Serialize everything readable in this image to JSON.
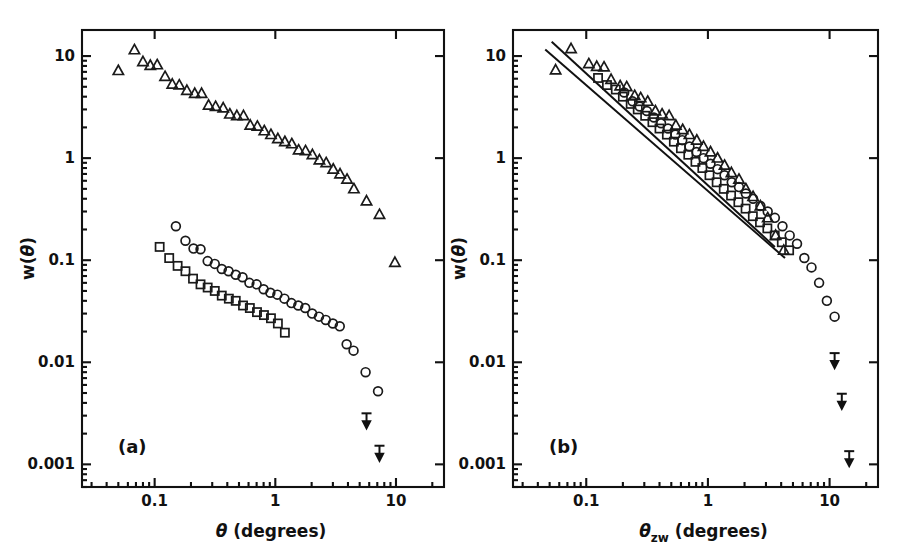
{
  "figure": {
    "caption_panels": [
      "(a)",
      "(b)"
    ],
    "background": "#ffffff",
    "ink": "#111111"
  },
  "panel_a": {
    "label": "(a)",
    "xlabel_symbol": "θ",
    "xlabel_units": "(degrees)",
    "ylabel": "w(θ)",
    "xticks": [
      "0.1",
      "1",
      "10"
    ],
    "yticks": [
      "10",
      "1",
      "0.1",
      "0.01",
      "0.001"
    ]
  },
  "panel_b": {
    "label": "(b)",
    "xlabel_symbol": "θ",
    "xlabel_subscript": "zw",
    "xlabel_units": "(degrees)",
    "ylabel": "w(θ)",
    "xticks": [
      "0.1",
      "1",
      "10"
    ],
    "yticks": [
      "10",
      "1",
      "0.1",
      "0.01",
      "0.001"
    ]
  },
  "chart_data": {
    "type": "scatter",
    "title": "",
    "xlabel": "θ (degrees)",
    "ylabel": "w(θ)",
    "xscale": "log",
    "yscale": "log",
    "xlim": [
      0.025,
      25
    ],
    "ylim": [
      0.0006,
      18
    ],
    "grid": false,
    "legend_position": "none",
    "panels": [
      {
        "panel": "(a)",
        "xlabel": "θ (degrees)",
        "ylabel": "w(θ)",
        "xlim": [
          0.025,
          25
        ],
        "ylim": [
          0.0006,
          18
        ],
        "xticks": [
          0.1,
          1,
          10
        ],
        "yticks": [
          10,
          1,
          0.1,
          0.01,
          0.001
        ],
        "series": [
          {
            "name": "triangles",
            "marker": "triangle",
            "x": [
              0.05,
              0.068,
              0.08,
              0.092,
              0.105,
              0.122,
              0.14,
              0.16,
              0.185,
              0.215,
              0.245,
              0.28,
              0.32,
              0.37,
              0.42,
              0.48,
              0.545,
              0.62,
              0.71,
              0.81,
              0.92,
              1.05,
              1.2,
              1.37,
              1.56,
              1.78,
              2.03,
              2.32,
              2.64,
              3.02,
              3.44,
              3.93,
              4.48,
              5.7,
              7.3,
              9.8
            ],
            "y": [
              7.2,
              11.5,
              8.8,
              8.1,
              8.2,
              6.3,
              5.3,
              5.2,
              4.6,
              4.3,
              4.3,
              3.3,
              3.2,
              3.1,
              2.7,
              2.6,
              2.6,
              2.1,
              2.05,
              1.85,
              1.7,
              1.55,
              1.45,
              1.38,
              1.2,
              1.18,
              1.08,
              0.96,
              0.9,
              0.78,
              0.7,
              0.62,
              0.5,
              0.38,
              0.28,
              0.095
            ]
          },
          {
            "name": "circles",
            "marker": "circle",
            "x": [
              0.15,
              0.18,
              0.21,
              0.24,
              0.275,
              0.315,
              0.36,
              0.41,
              0.47,
              0.535,
              0.61,
              0.7,
              0.8,
              0.91,
              1.04,
              1.19,
              1.36,
              1.55,
              1.77,
              2.02,
              2.3,
              2.62,
              3.0,
              3.42,
              3.9,
              4.45,
              5.6,
              7.1
            ],
            "y": [
              0.215,
              0.155,
              0.13,
              0.128,
              0.098,
              0.092,
              0.082,
              0.078,
              0.072,
              0.068,
              0.06,
              0.058,
              0.052,
              0.048,
              0.046,
              0.042,
              0.038,
              0.036,
              0.034,
              0.03,
              0.028,
              0.026,
              0.024,
              0.0225,
              0.015,
              0.013,
              0.008,
              0.0052
            ]
          },
          {
            "name": "squares",
            "marker": "square",
            "x": [
              0.11,
              0.132,
              0.155,
              0.18,
              0.208,
              0.24,
              0.275,
              0.315,
              0.36,
              0.412,
              0.47,
              0.54,
              0.615,
              0.705,
              0.805,
              0.92,
              1.05,
              1.2
            ],
            "y": [
              0.135,
              0.105,
              0.088,
              0.078,
              0.066,
              0.058,
              0.054,
              0.05,
              0.045,
              0.042,
              0.04,
              0.036,
              0.034,
              0.031,
              0.029,
              0.027,
              0.024,
              0.0195
            ]
          },
          {
            "name": "upper_limits",
            "marker": "downward-arrow",
            "x": [
              5.7,
              7.3
            ],
            "y": [
              0.0027,
              0.0013
            ]
          }
        ]
      },
      {
        "panel": "(b)",
        "xlabel": "θ_zw (degrees)",
        "ylabel": "w(θ)",
        "xlim": [
          0.025,
          25
        ],
        "ylim": [
          0.0006,
          18
        ],
        "xticks": [
          0.1,
          1,
          10
        ],
        "yticks": [
          10,
          1,
          0.1,
          0.01,
          0.001
        ],
        "fit_lines": [
          {
            "name": "upper-fit-line",
            "x": [
              0.052,
              3.55
            ],
            "y": [
              13.8,
              0.135
            ],
            "slope": -1.13
          },
          {
            "name": "lower-fit-line",
            "x": [
              0.046,
              4.3
            ],
            "y": [
              11.6,
              0.105
            ],
            "slope": -1.04
          }
        ],
        "series": [
          {
            "name": "triangles",
            "marker": "triangle",
            "x": [
              0.056,
              0.075,
              0.105,
              0.122,
              0.14,
              0.16,
              0.19,
              0.215,
              0.25,
              0.28,
              0.32,
              0.37,
              0.42,
              0.48,
              0.545,
              0.62,
              0.705,
              0.81,
              0.92,
              1.05,
              1.2,
              1.37,
              1.56,
              1.8,
              2.05,
              2.35,
              2.7,
              3.1,
              3.6,
              4.2
            ],
            "y": [
              7.3,
              11.8,
              8.4,
              7.9,
              7.8,
              5.9,
              5.1,
              5.0,
              4.1,
              3.9,
              3.6,
              2.9,
              2.7,
              2.6,
              2.1,
              1.9,
              1.7,
              1.5,
              1.3,
              1.15,
              1.0,
              0.85,
              0.72,
              0.62,
              0.5,
              0.42,
              0.34,
              0.26,
              0.175,
              0.125
            ]
          },
          {
            "name": "circles",
            "marker": "circle",
            "x": [
              0.205,
              0.24,
              0.275,
              0.315,
              0.36,
              0.412,
              0.47,
              0.54,
              0.615,
              0.705,
              0.805,
              0.92,
              1.05,
              1.2,
              1.37,
              1.57,
              1.8,
              2.05,
              2.35,
              2.7,
              3.1,
              3.55,
              4.1,
              4.7,
              5.4,
              6.2,
              7.1,
              8.2,
              9.5,
              11.0
            ],
            "y": [
              4.4,
              3.6,
              3.2,
              2.9,
              2.5,
              2.2,
              1.95,
              1.7,
              1.5,
              1.3,
              1.15,
              1.0,
              0.88,
              0.78,
              0.68,
              0.58,
              0.52,
              0.45,
              0.4,
              0.34,
              0.3,
              0.26,
              0.215,
              0.175,
              0.145,
              0.105,
              0.085,
              0.06,
              0.04,
              0.028
            ]
          },
          {
            "name": "squares",
            "marker": "square",
            "x": [
              0.125,
              0.148,
              0.175,
              0.2,
              0.232,
              0.265,
              0.305,
              0.35,
              0.4,
              0.46,
              0.525,
              0.6,
              0.69,
              0.79,
              0.9,
              1.03,
              1.18,
              1.35,
              1.55,
              1.78,
              2.04,
              2.34,
              2.68,
              3.08,
              3.54,
              4.05,
              4.65
            ],
            "y": [
              6.1,
              5.2,
              4.7,
              4.0,
              3.4,
              3.0,
              2.6,
              2.25,
              1.95,
              1.7,
              1.45,
              1.25,
              1.08,
              0.92,
              0.8,
              0.68,
              0.58,
              0.5,
              0.43,
              0.37,
              0.32,
              0.27,
              0.235,
              0.205,
              0.175,
              0.15,
              0.125
            ]
          },
          {
            "name": "upper_limits",
            "marker": "downward-arrow",
            "x": [
              11.0,
              12.6,
              14.5
            ],
            "y": [
              0.0105,
              0.0042,
              0.00115
            ]
          }
        ]
      }
    ]
  }
}
